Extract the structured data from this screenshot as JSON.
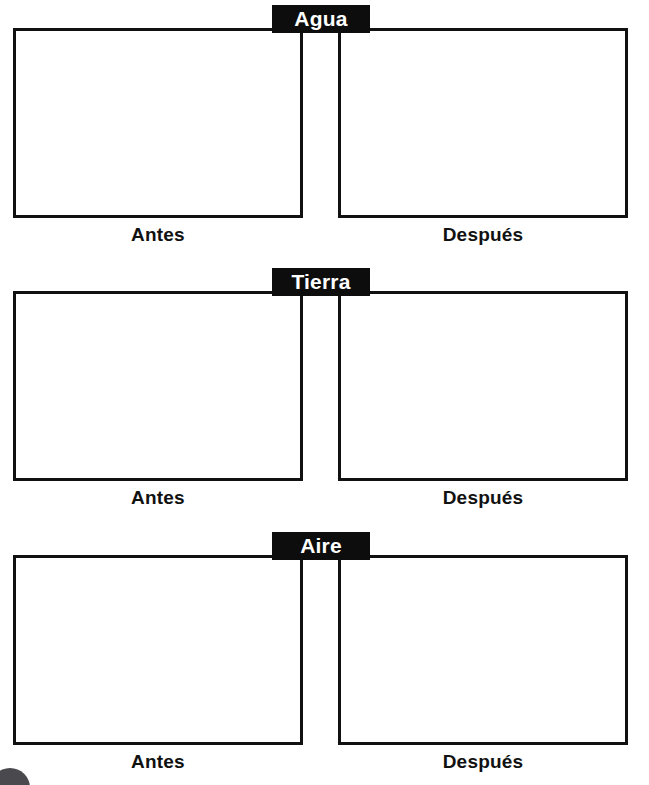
{
  "page": {
    "background_color": "#ffffff",
    "ink_color": "#111111",
    "tab_background_color": "#0d0d0d",
    "tab_text_color": "#ffffff",
    "corner_mark_color": "#4a4a4e"
  },
  "sections": [
    {
      "id": "agua",
      "title": "Agua",
      "frames": [
        {
          "side": "left",
          "caption": "Antes"
        },
        {
          "side": "right",
          "caption": "Después"
        }
      ]
    },
    {
      "id": "tierra",
      "title": "Tierra",
      "frames": [
        {
          "side": "left",
          "caption": "Antes"
        },
        {
          "side": "right",
          "caption": "Después"
        }
      ]
    },
    {
      "id": "aire",
      "title": "Aire",
      "frames": [
        {
          "side": "left",
          "caption": "Antes"
        },
        {
          "side": "right",
          "caption": "Después"
        }
      ]
    }
  ],
  "corner_mark": {
    "icon": "filled-circle-icon"
  }
}
